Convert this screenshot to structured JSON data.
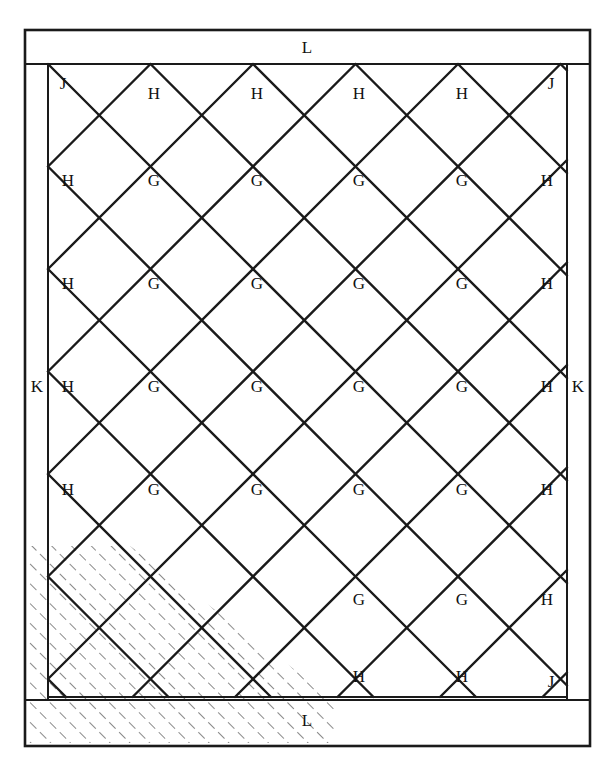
{
  "figure": {
    "name": "quilt-block-layout-diagram",
    "type": "diagram",
    "background_color": "#ffffff",
    "line_color": "#1a1a1a",
    "hatch_color": "#555555"
  },
  "geometry": {
    "outer_border": {
      "x": 25,
      "y": 30,
      "width": 565,
      "height": 716,
      "stroke_width": 2.5
    },
    "top_border_band": {
      "x": 28,
      "y": 33,
      "width": 559,
      "height": 31
    },
    "bottom_border_band": {
      "x": 28,
      "y": 700,
      "width": 559,
      "height": 43
    },
    "left_border_band": {
      "x": 28,
      "y": 64,
      "width": 20,
      "height": 636
    },
    "right_border_band": {
      "x": 567,
      "y": 64,
      "width": 20,
      "height": 636
    },
    "field": {
      "x": 48,
      "y": 64,
      "width": 519,
      "height": 636
    },
    "diamond_pitch": 102.5,
    "half_pitch": 51.25,
    "columns": 5,
    "rows": 6,
    "field_left": 48,
    "field_right": 567,
    "field_top": 64,
    "field_bottom": 697
  },
  "labels": {
    "corner_j": "J",
    "edge_triangle_h": "H",
    "center_square_g": "G",
    "side_border_k": "K",
    "top_bottom_border_l": "L"
  },
  "label_placements": {
    "top_border": [
      {
        "text": "L",
        "x": 307,
        "y": 49
      }
    ],
    "bottom_border": [
      {
        "text": "L",
        "x": 307,
        "y": 722
      }
    ],
    "left_border": [
      {
        "text": "K",
        "x": 37,
        "y": 388
      }
    ],
    "right_border": [
      {
        "text": "K",
        "x": 578,
        "y": 388
      }
    ],
    "field": [
      {
        "text": "J",
        "x": 63,
        "y": 85
      },
      {
        "text": "H",
        "x": 154,
        "y": 95
      },
      {
        "text": "H",
        "x": 257,
        "y": 95
      },
      {
        "text": "H",
        "x": 359,
        "y": 95
      },
      {
        "text": "H",
        "x": 462,
        "y": 95
      },
      {
        "text": "J",
        "x": 551,
        "y": 85
      },
      {
        "text": "H",
        "x": 68,
        "y": 182
      },
      {
        "text": "G",
        "x": 154,
        "y": 182
      },
      {
        "text": "G",
        "x": 257,
        "y": 182
      },
      {
        "text": "G",
        "x": 359,
        "y": 182
      },
      {
        "text": "G",
        "x": 462,
        "y": 182
      },
      {
        "text": "H",
        "x": 547,
        "y": 182
      },
      {
        "text": "H",
        "x": 68,
        "y": 285
      },
      {
        "text": "G",
        "x": 154,
        "y": 285
      },
      {
        "text": "G",
        "x": 257,
        "y": 285
      },
      {
        "text": "G",
        "x": 359,
        "y": 285
      },
      {
        "text": "G",
        "x": 462,
        "y": 285
      },
      {
        "text": "H",
        "x": 547,
        "y": 285
      },
      {
        "text": "H",
        "x": 68,
        "y": 388
      },
      {
        "text": "G",
        "x": 154,
        "y": 388
      },
      {
        "text": "G",
        "x": 257,
        "y": 388
      },
      {
        "text": "G",
        "x": 359,
        "y": 388
      },
      {
        "text": "G",
        "x": 462,
        "y": 388
      },
      {
        "text": "H",
        "x": 547,
        "y": 388
      },
      {
        "text": "H",
        "x": 68,
        "y": 491
      },
      {
        "text": "G",
        "x": 154,
        "y": 491
      },
      {
        "text": "G",
        "x": 257,
        "y": 491
      },
      {
        "text": "G",
        "x": 359,
        "y": 491
      },
      {
        "text": "G",
        "x": 462,
        "y": 491
      },
      {
        "text": "H",
        "x": 547,
        "y": 491
      },
      {
        "text": "G",
        "x": 359,
        "y": 601
      },
      {
        "text": "G",
        "x": 462,
        "y": 601
      },
      {
        "text": "H",
        "x": 547,
        "y": 601
      },
      {
        "text": "H",
        "x": 359,
        "y": 678
      },
      {
        "text": "H",
        "x": 462,
        "y": 678
      },
      {
        "text": "J",
        "x": 551,
        "y": 683
      }
    ]
  },
  "hatched_area": {
    "name": "quilting-hatch-region",
    "style": "dashed-45-degree-diagonal",
    "angle_degrees": 45,
    "spacing_px": 14,
    "dash_pattern": "9 7",
    "stroke_width": 1.4,
    "covers": "lower-left corner of field plus left border band and left portion of bottom border"
  },
  "legend_keys": [
    {
      "key": "G",
      "meaning": "center square set on point"
    },
    {
      "key": "H",
      "meaning": "side setting triangle"
    },
    {
      "key": "J",
      "meaning": "corner setting triangle"
    },
    {
      "key": "K",
      "meaning": "side border strip"
    },
    {
      "key": "L",
      "meaning": "top and bottom border strip"
    }
  ]
}
